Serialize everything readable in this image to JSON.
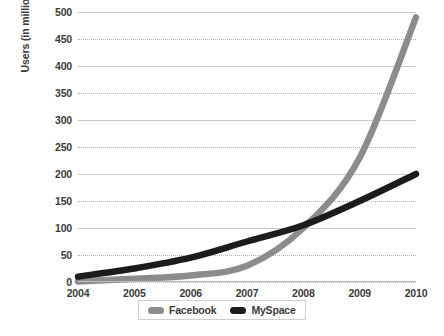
{
  "chart_data": {
    "type": "line",
    "title": "",
    "xlabel": "",
    "ylabel": "Users (in millions)",
    "x": [
      2004,
      2005,
      2006,
      2007,
      2008,
      2009,
      2010
    ],
    "categories": [
      "2004",
      "2005",
      "2006",
      "2007",
      "2008",
      "2009",
      "2010"
    ],
    "xlim": [
      2004,
      2010
    ],
    "ylim": [
      0,
      500
    ],
    "yticks": [
      0,
      50,
      100,
      150,
      200,
      250,
      300,
      350,
      400,
      450,
      500
    ],
    "ytick_labels": [
      "0",
      "50",
      "100",
      "150",
      "200",
      "250",
      "300",
      "350",
      "400",
      "450",
      "500"
    ],
    "grid": true,
    "grid_style": "dotted-horizontal",
    "legend_position": "bottom-center",
    "series": [
      {
        "name": "Facebook",
        "color": "#8c8c8c",
        "values": [
          1,
          6,
          12,
          30,
          100,
          230,
          490
        ]
      },
      {
        "name": "MySpace",
        "color": "#1c1c1c",
        "values": [
          10,
          25,
          45,
          75,
          105,
          150,
          200
        ]
      }
    ]
  },
  "legend": {
    "items": [
      {
        "label": "Facebook",
        "color": "#8c8c8c"
      },
      {
        "label": "MySpace",
        "color": "#1c1c1c"
      }
    ]
  }
}
